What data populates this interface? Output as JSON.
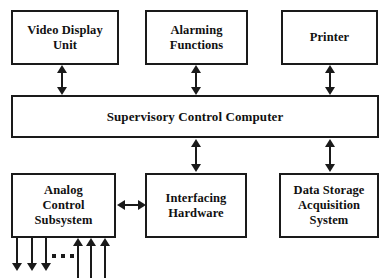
{
  "diagram": {
    "type": "block-diagram",
    "style": {
      "border_color": "#1a1a1a",
      "box_fill": "#ffffff",
      "text_color": "#111111",
      "background": "#ffffff"
    },
    "blocks": [
      {
        "id": "video-display-unit",
        "label": "Video Display\nUnit",
        "row": "top",
        "col": 1
      },
      {
        "id": "alarming-functions",
        "label": "Alarming\nFunctions",
        "row": "top",
        "col": 2
      },
      {
        "id": "printer",
        "label": "Printer",
        "row": "top",
        "col": 3
      },
      {
        "id": "supervisory-control-computer",
        "label": "Supervisory Control Computer",
        "row": "middle",
        "col": 0
      },
      {
        "id": "analog-control-subsystem",
        "label": "Analog\nControl\nSubsystem",
        "row": "bottom",
        "col": 1
      },
      {
        "id": "interfacing-hardware",
        "label": "Interfacing\nHardware",
        "row": "bottom",
        "col": 2
      },
      {
        "id": "data-storage-acquisition-system",
        "label": "Data Storage\nAcquisition\nSystem",
        "row": "bottom",
        "col": 3
      }
    ],
    "connectors": [
      {
        "id": "vdu-to-scc",
        "from": "video-display-unit",
        "to": "supervisory-control-computer",
        "kind": "bidirectional-vertical"
      },
      {
        "id": "alarm-to-scc",
        "from": "alarming-functions",
        "to": "supervisory-control-computer",
        "kind": "bidirectional-vertical"
      },
      {
        "id": "printer-to-scc",
        "from": "printer",
        "to": "supervisory-control-computer",
        "kind": "bidirectional-vertical"
      },
      {
        "id": "scc-to-interface",
        "from": "supervisory-control-computer",
        "to": "interfacing-hardware",
        "kind": "bidirectional-vertical"
      },
      {
        "id": "scc-to-storage",
        "from": "supervisory-control-computer",
        "to": "data-storage-acquisition-system",
        "kind": "bidirectional-vertical"
      },
      {
        "id": "analog-to-interface",
        "from": "analog-control-subsystem",
        "to": "interfacing-hardware",
        "kind": "bidirectional-horizontal"
      }
    ],
    "io_signals": {
      "outputs": {
        "count": 3,
        "direction": "down",
        "label": ""
      },
      "inputs": {
        "count": 3,
        "direction": "up",
        "label": ""
      },
      "ellipsis": "•••"
    }
  }
}
